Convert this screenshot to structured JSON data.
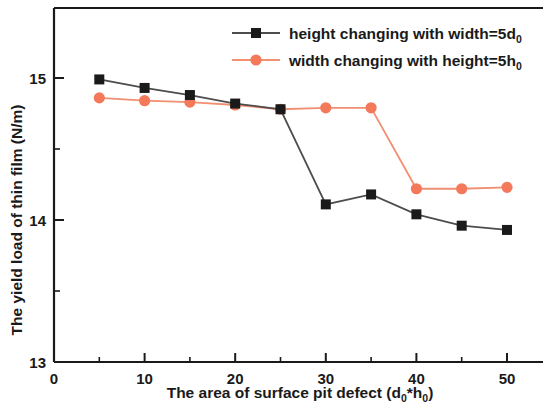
{
  "chart_data": {
    "type": "line",
    "title": "",
    "xlabel": "The area of surface pit defect (d0*h0)",
    "ylabel": "The yield load of thin film (N/m)",
    "xlabel_parts": {
      "main": "The area of surface pit defect (d",
      "sub1": "0",
      "mid": "*h",
      "sub2": "0",
      "end": ")"
    },
    "ylabel_text": "The yield load of thin film (N/m)",
    "xlim": [
      0,
      54
    ],
    "ylim": [
      13,
      15.35
    ],
    "x_ticks": [
      0,
      10,
      20,
      30,
      40,
      50
    ],
    "x_tick_labels": [
      "0",
      "10",
      "20",
      "30",
      "40",
      "50"
    ],
    "x_minor_ticks": [
      5,
      15,
      25,
      35,
      45
    ],
    "y_ticks": [
      13,
      14,
      15
    ],
    "y_tick_labels": [
      "13",
      "14",
      "15"
    ],
    "y_minor_ticks": [
      13.5,
      14.5
    ],
    "grid": false,
    "legend_position": "top-right",
    "x": [
      5,
      10,
      15,
      20,
      25,
      30,
      35,
      40,
      45,
      50
    ],
    "series": [
      {
        "name": "height changing with width=5d0",
        "legend_main": "height changing with width=5d",
        "legend_sub": "0",
        "marker": "square",
        "color": "#1a1a1a",
        "line_color": "#4d4d4d",
        "values": [
          14.99,
          14.93,
          14.88,
          14.82,
          14.78,
          14.11,
          14.18,
          14.04,
          13.96,
          13.93
        ]
      },
      {
        "name": "width changing with height=5h0",
        "legend_main": "width changing with height=5h",
        "legend_sub": "0",
        "marker": "circle",
        "color": "#f4795b",
        "line_color": "#f08f72",
        "values": [
          14.86,
          14.84,
          14.83,
          14.81,
          14.78,
          14.79,
          14.79,
          14.22,
          14.22,
          14.23
        ]
      }
    ]
  }
}
